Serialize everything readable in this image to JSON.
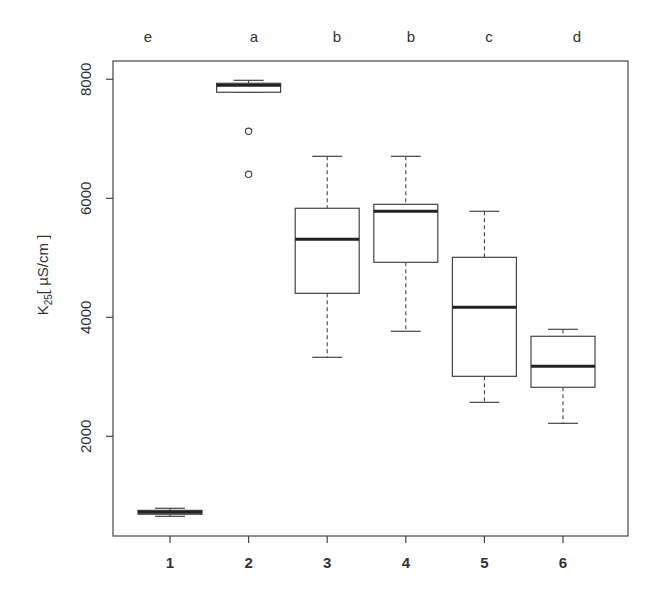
{
  "chart_data": {
    "type": "box",
    "title": "",
    "xlabel": "",
    "ylabel": "K25 [ µS/cm ]",
    "ylabel_main": "K",
    "ylabel_sub": "25",
    "ylabel_unit": "[ µS/cm ]",
    "categories": [
      "1",
      "2",
      "3",
      "4",
      "5",
      "6"
    ],
    "group_letters": [
      "e",
      "a",
      "b",
      "b",
      "c",
      "d"
    ],
    "yticks": [
      2000,
      4000,
      6000,
      8000
    ],
    "ylim": [
      -320,
      8300
    ],
    "grid": false,
    "series": [
      {
        "name": "1",
        "whisker_low": 655,
        "q1": 690,
        "median": 723,
        "q3": 755,
        "whisker_high": 790,
        "outliers": []
      },
      {
        "name": "2",
        "whisker_low": 7782,
        "q1": 7782,
        "median": 7899,
        "q3": 7933,
        "whisker_high": 7983,
        "outliers": [
          7126,
          6403
        ]
      },
      {
        "name": "3",
        "whisker_low": 3328,
        "q1": 4403,
        "median": 5311,
        "q3": 5832,
        "whisker_high": 6706,
        "outliers": []
      },
      {
        "name": "4",
        "whisker_low": 3765,
        "q1": 4924,
        "median": 5782,
        "q3": 5899,
        "whisker_high": 6706,
        "outliers": []
      },
      {
        "name": "5",
        "whisker_low": 2571,
        "q1": 3008,
        "median": 4168,
        "q3": 5008,
        "whisker_high": 5782,
        "outliers": []
      },
      {
        "name": "6",
        "whisker_low": 2218,
        "q1": 2824,
        "median": 3176,
        "q3": 3681,
        "whisker_high": 3798,
        "outliers": []
      }
    ]
  },
  "style": {
    "line_color": "#444444",
    "median_color": "#222222",
    "text_color": "#333333",
    "background": "#ffffff"
  }
}
